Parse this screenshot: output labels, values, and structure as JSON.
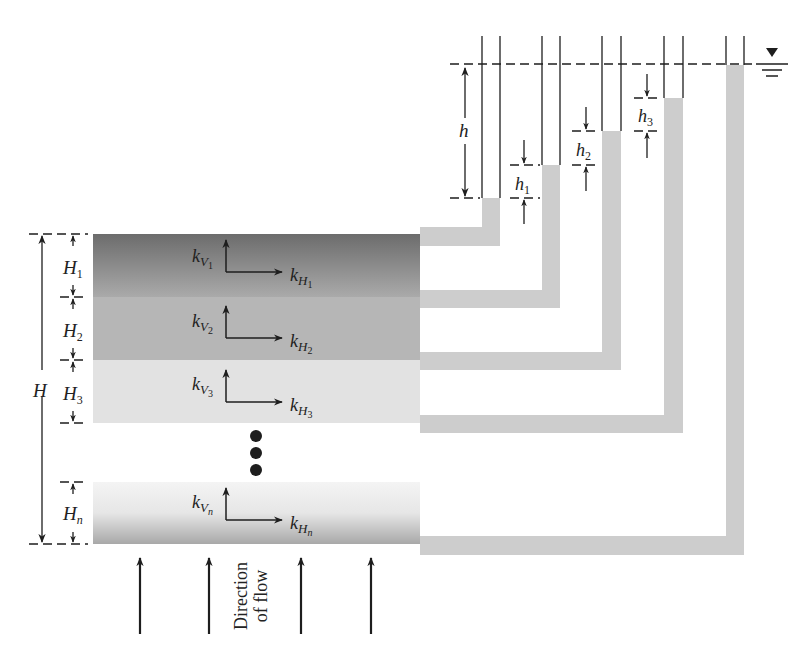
{
  "colors": {
    "pipe": "#cdcdcd",
    "ink": "#1e1e1e",
    "layer1_top": "#6c6c6c",
    "layer1_bottom": "#a9a9a9",
    "layer2": "#b6b6b6",
    "layer3": "#e2e2e2",
    "layern_top": "#f2f2f2",
    "layern_bottom": "#a8a8a8"
  },
  "labels": {
    "total_thickness": "H",
    "total_head": "h",
    "flow_line1": "Direction",
    "flow_line2": "of flow"
  },
  "layers": [
    {
      "thickness": "H",
      "thickness_sub": "1",
      "kv": "k",
      "kv_sub": "V",
      "kv_subsub": "1",
      "kh": "k",
      "kh_sub": "H",
      "kh_subsub": "1"
    },
    {
      "thickness": "H",
      "thickness_sub": "2",
      "kv": "k",
      "kv_sub": "V",
      "kv_subsub": "2",
      "kh": "k",
      "kh_sub": "H",
      "kh_subsub": "2"
    },
    {
      "thickness": "H",
      "thickness_sub": "3",
      "kv": "k",
      "kv_sub": "V",
      "kv_subsub": "3",
      "kh": "k",
      "kh_sub": "H",
      "kh_subsub": "3"
    },
    {
      "thickness": "H",
      "thickness_sub": "n",
      "kv": "k",
      "kv_sub": "V",
      "kv_subsub": "n",
      "kh": "k",
      "kh_sub": "H",
      "kh_subsub": "n"
    }
  ],
  "head_losses": [
    {
      "label": "h",
      "sub": "1"
    },
    {
      "label": "h",
      "sub": "2"
    },
    {
      "label": "h",
      "sub": "3"
    }
  ],
  "continuation": "• • •"
}
